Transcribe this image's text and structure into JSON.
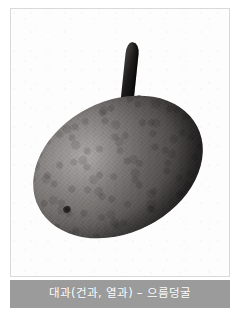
{
  "page": {
    "background_color": "#ffffff",
    "border_color": "#d9d9d9"
  },
  "figure": {
    "alt_name": "akebia-fruit-photograph",
    "subject": "으름덩굴",
    "orientation": "upper-right to lower-left",
    "palette": {
      "skin_light": "#8d8987",
      "skin_mid": "#6a6664",
      "skin_dark": "#3a3837",
      "stem_dark": "#111010",
      "plate_white": "#fdfdfd"
    }
  },
  "caption": {
    "text": "대과(건과, 열과) – 으름덩굴",
    "background_color": "#9b9b9b",
    "text_color": "#ffffff"
  }
}
